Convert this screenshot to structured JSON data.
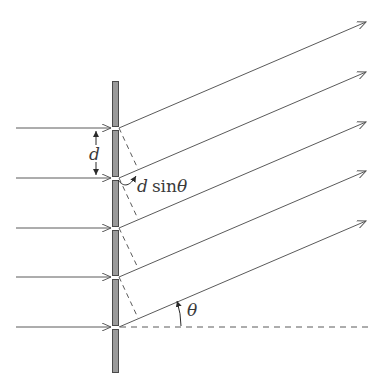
{
  "diagram": {
    "colors": {
      "line": "#5a5a5a",
      "grating_fill": "#9a9a9a",
      "grating_stroke": "#4a4a4a",
      "text": "#3a3a3a"
    },
    "grating": {
      "x": 112,
      "width": 7,
      "top": 81,
      "bottom": 372,
      "slit_ys": [
        128,
        178,
        228,
        277,
        327
      ]
    },
    "incoming_rays": {
      "x_start": 16,
      "x_end": 112
    },
    "outgoing_ray_tip_x": 367,
    "outgoing_ray_rise": 106,
    "labels": {
      "d": "d",
      "d_sin_theta_var": "d",
      "d_sin_theta_fn": "sin",
      "d_sin_theta_angle": "θ",
      "theta": "θ"
    }
  }
}
